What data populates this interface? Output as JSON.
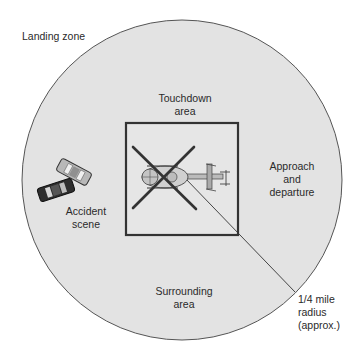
{
  "diagram": {
    "title": "Landing zone",
    "colors": {
      "background": "#ffffff",
      "zone_fill": "#e3e3e3",
      "zone_stroke": "#555555",
      "square_stroke": "#333333",
      "text": "#2a2a2a"
    },
    "labels": {
      "landing_zone": "Landing zone",
      "touchdown": [
        "Touchdown",
        "area"
      ],
      "approach": [
        "Approach",
        "and",
        "departure"
      ],
      "accident": [
        "Accident",
        "scene"
      ],
      "surrounding": [
        "Surrounding",
        "area"
      ],
      "radius": [
        "1/4 mile",
        "radius",
        "(approx.)"
      ]
    },
    "icons": {
      "helicopter": "helicopter-top-view-icon",
      "vehicles": "crashed-cars-icon"
    }
  }
}
